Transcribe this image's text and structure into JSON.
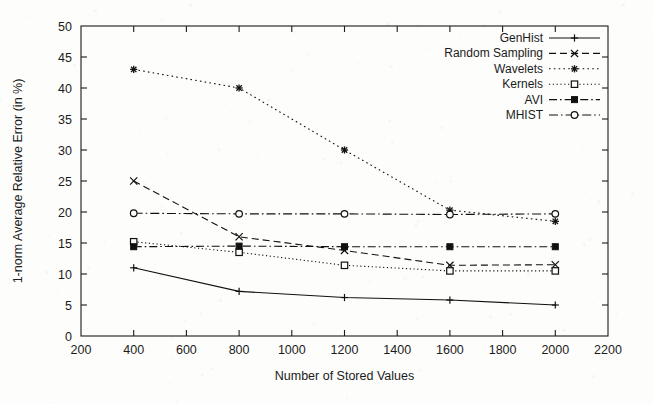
{
  "chart_data": {
    "type": "line",
    "title": "",
    "xlabel": "Number of Stored Values",
    "ylabel": "1-norm Average Relative Error (in %)",
    "xlim": [
      200,
      2200
    ],
    "ylim": [
      0,
      50
    ],
    "xticks": [
      200,
      400,
      600,
      800,
      1000,
      1200,
      1400,
      1600,
      1800,
      2000,
      2200
    ],
    "yticks": [
      0,
      5,
      10,
      15,
      20,
      25,
      30,
      35,
      40,
      45,
      50
    ],
    "grid": false,
    "legend_position": "top-right inside",
    "x": [
      400,
      800,
      1200,
      1600,
      2000
    ],
    "series": [
      {
        "name": "GenHist",
        "values": [
          11.0,
          7.2,
          6.2,
          5.8,
          5.0
        ],
        "marker": "plus",
        "dash": "solid"
      },
      {
        "name": "Random Sampling",
        "values": [
          25.0,
          16.0,
          13.8,
          11.4,
          11.5
        ],
        "marker": "cross",
        "dash": "dashed"
      },
      {
        "name": "Wavelets",
        "values": [
          43.0,
          40.0,
          30.0,
          20.3,
          18.5
        ],
        "marker": "star",
        "dash": "dotted"
      },
      {
        "name": "Kernels",
        "values": [
          15.2,
          13.5,
          11.4,
          10.5,
          10.5
        ],
        "marker": "open-square",
        "dash": "fine-dotted"
      },
      {
        "name": "AVI",
        "values": [
          14.4,
          14.5,
          14.4,
          14.4,
          14.4
        ],
        "marker": "filled-square",
        "dash": "dash-dot"
      },
      {
        "name": "MHIST",
        "values": [
          19.8,
          19.7,
          19.7,
          19.6,
          19.7
        ],
        "marker": "open-circle",
        "dash": "dash-dot-long"
      }
    ]
  },
  "colors": {
    "ink": "#111111",
    "paper": "#fdfdfb"
  }
}
